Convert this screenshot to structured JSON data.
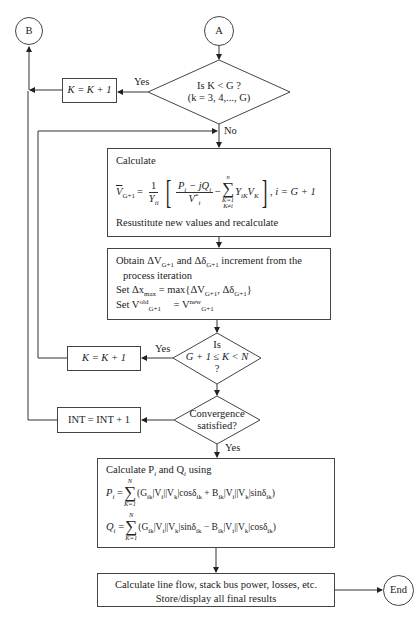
{
  "connectors": {
    "start": "A",
    "exit_b": "B",
    "end": "End"
  },
  "decisions": {
    "k_less_g": {
      "line1": "Is K < G ?",
      "line2": "(k = 3, 4,..., G)",
      "yes": "Yes",
      "no": "No"
    },
    "k_range": {
      "line1": "Is",
      "line2": "G + 1 ≤ K < N",
      "line3": "?",
      "yes": "Yes"
    },
    "convergence": {
      "line1": "Convergence",
      "line2": "satisfied?",
      "yes": "Yes"
    }
  },
  "process": {
    "k_increment_1": "K = K + 1",
    "k_increment_2": "K = K + 1",
    "int_increment": "INT = INT + 1",
    "calculate_box": {
      "heading": "Calculate",
      "lhs": "V",
      "lhs_sub": "G+1",
      "equals": "=",
      "frac1_num": "1",
      "frac1_den": "Y",
      "frac1_den_sub": "ii",
      "frac2_num": "P",
      "frac2_num_sub": "i",
      "frac2_num_mid": " − jQ",
      "frac2_num_sub2": "i",
      "frac2_den": "V",
      "frac2_den_sup": "*",
      "frac2_den_sub": "i",
      "minus": "−",
      "sum_upper": "n",
      "sum_lower1": "K=1",
      "sum_lower2": "K≠i",
      "term": "Y",
      "term_sub": "iK",
      "term2": "V",
      "term2_sub": "K",
      "condition": ", i = G + 1",
      "footer": "Resustitute new values and recalculate"
    },
    "obtain_box": {
      "line1_a": "Obtain ΔV",
      "line1_sub1": "G+1",
      "line1_b": " and Δδ",
      "line1_sub2": "G+1",
      "line1_c": " increment from the",
      "line2": "process iteration",
      "line3_a": "Set Δx",
      "line3_sub": "max",
      "line3_b": " = max{ΔV",
      "line3_sub2": "G+1",
      "line3_c": ", Δδ",
      "line3_sub3": "G+1",
      "line3_d": "}",
      "line4_a": "Set V",
      "line4_sup": "old",
      "line4_sub": "G+1",
      "line4_b": " = V",
      "line4_sup2": "new",
      "line4_sub2": "G+1"
    },
    "pq_box": {
      "heading": "Calculate P",
      "heading_sub1": "i",
      "heading_mid": " and Q",
      "heading_sub2": "i",
      "heading_end": " using",
      "p_lhs": "P",
      "p_lhs_sub": "i",
      "q_lhs": "Q",
      "q_lhs_sub": "i",
      "sum_upper": "N",
      "sum_lower": "K=1",
      "p_body": "(G|V||V|cosδ + B|V||V|sinδ)",
      "p_expr": "(G<sub>ik</sub>|V<sub>i</sub>||V<sub>k</sub>|cosδ<sub>ik</sub> + B<sub>ik</sub>|V<sub>i</sub>||V<sub>k</sub>|sinδ<sub>ik</sub>)",
      "q_expr": "(G<sub>ik</sub>|V<sub>i</sub>||V<sub>k</sub>|sinδ<sub>ik</sub> − B<sub>ik</sub>|V<sub>i</sub>||V<sub>k</sub>|cosδ<sub>ik</sub>)"
    },
    "final_box": {
      "line1": "Calculate line flow, stack bus power, losses, etc.",
      "line2": "Store/display all final results"
    }
  }
}
